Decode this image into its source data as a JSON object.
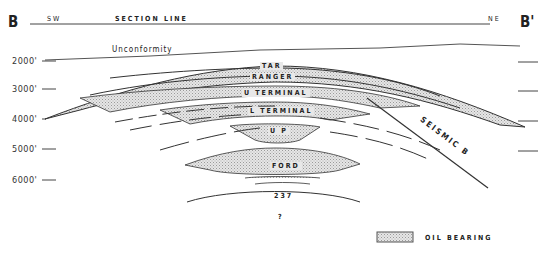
{
  "section": {
    "start_label": "B",
    "end_label": "B'",
    "left_direction": "SW",
    "right_direction": "NE",
    "title": "SECTION LINE"
  },
  "unconformity_label": "Unconformity",
  "depth_axis": [
    "2000'",
    "3000'",
    "4000'",
    "5000'",
    "6000'"
  ],
  "units": [
    {
      "name": "TAR"
    },
    {
      "name": "RANGER"
    },
    {
      "name": "U TERMINAL"
    },
    {
      "name": "L TERMINAL"
    },
    {
      "name": "U P"
    },
    {
      "name": "FORD"
    },
    {
      "name": "237"
    },
    {
      "name": "?"
    }
  ],
  "fault_label": "SEISMIC B",
  "legend": {
    "label": "OIL BEARING",
    "fill_color": "#d9d9d9"
  },
  "colors": {
    "line": "#333333",
    "oil_fill": "#d9d9d9"
  }
}
